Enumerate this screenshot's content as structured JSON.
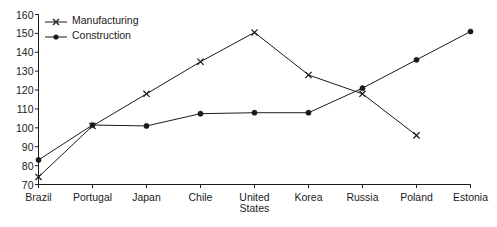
{
  "chart_data": {
    "type": "line",
    "title": "",
    "subtitle": "",
    "xlabel": "",
    "ylabel": "",
    "categories": [
      "Brazil",
      "Portugal",
      "Japan",
      "Chile",
      "United States",
      "Korea",
      "Russia",
      "Poland",
      "Estonia"
    ],
    "category_lines": [
      [
        "Brazil"
      ],
      [
        "Portugal"
      ],
      [
        "Japan"
      ],
      [
        "Chile"
      ],
      [
        "United",
        "States"
      ],
      [
        "Korea"
      ],
      [
        "Russia"
      ],
      [
        "Poland"
      ],
      [
        "Estonia"
      ]
    ],
    "series": [
      {
        "name": "Manufacturing",
        "marker": "x-cross",
        "color": "#1b1b1b",
        "values": [
          74,
          101,
          118,
          135,
          150.5,
          128,
          118,
          96,
          null
        ]
      },
      {
        "name": "Construction",
        "marker": "filled-circle",
        "color": "#1b1b1b",
        "values": [
          83,
          101.5,
          101,
          107.5,
          108,
          108,
          121,
          136,
          151
        ]
      }
    ],
    "ylim": [
      70,
      160
    ],
    "yticks": [
      70,
      80,
      90,
      100,
      110,
      120,
      130,
      140,
      150,
      160
    ],
    "ytick_labels": [
      "70",
      "80",
      "90",
      "100",
      "110",
      "120",
      "130",
      "140",
      "150",
      "160"
    ],
    "grid": false,
    "legend_position": "top-left-inside",
    "axis_color": "#1b1b1b",
    "background": "#ffffff"
  },
  "legend": {
    "entries": [
      {
        "label": "Manufacturing"
      },
      {
        "label": "Construction"
      }
    ]
  }
}
